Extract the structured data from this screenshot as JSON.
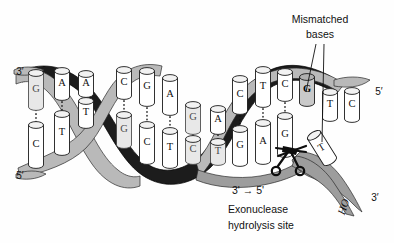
{
  "figure": {
    "background_color": "#fefefe"
  },
  "labels": {
    "mismatched_line1": "Mismatched",
    "mismatched_line2": "bases",
    "direction": "3'  →  5'",
    "site_line1": "Exonuclease",
    "site_line2": "hydrolysis site",
    "ho_label": "HO",
    "end_top_left": "3′",
    "end_bottom_left": "5′",
    "end_top_right": "5′",
    "end_bottom_right": "3′"
  },
  "colors": {
    "ribbon_dark": "#1c1c1c",
    "ribbon_light": "#b9b9b9",
    "ribbon_mid": "#9d9d9d",
    "base_fill": "#ffffff",
    "mismatch_fill": "#c9c9c9",
    "ink": "#111111"
  },
  "strands": {
    "top_strand_3prime_to_right": [
      "G",
      "A",
      "A",
      "C",
      "G",
      "A",
      "G",
      "A",
      "C",
      "T",
      "C",
      "G",
      "T",
      "C"
    ],
    "bottom_strand_5prime_to_right": [
      "C",
      "T",
      "T",
      "G",
      "C",
      "T",
      "C",
      "T",
      "G",
      "A",
      "G",
      "T"
    ]
  },
  "bases": {
    "top": [
      {
        "id": "t1",
        "letter": "G",
        "x": 36,
        "y": 90,
        "style": "faint",
        "h": 34
      },
      {
        "id": "t2",
        "letter": "A",
        "x": 62,
        "y": 84,
        "style": "plain",
        "h": 26
      },
      {
        "id": "t3",
        "letter": "A",
        "x": 86,
        "y": 84,
        "style": "plain",
        "h": 20
      },
      {
        "id": "t4",
        "letter": "C",
        "x": 124,
        "y": 83,
        "style": "plain",
        "h": 26
      },
      {
        "id": "t5",
        "letter": "G",
        "x": 147,
        "y": 87,
        "style": "plain",
        "h": 32
      },
      {
        "id": "t6",
        "letter": "A",
        "x": 170,
        "y": 95,
        "style": "plain",
        "h": 34
      },
      {
        "id": "t7",
        "letter": "G",
        "x": 193,
        "y": 118,
        "style": "faint",
        "h": 26
      },
      {
        "id": "t8",
        "letter": "A",
        "x": 218,
        "y": 120,
        "style": "plain",
        "h": 22
      },
      {
        "id": "t9",
        "letter": "C",
        "x": 240,
        "y": 95,
        "style": "plain",
        "h": 32
      },
      {
        "id": "t10",
        "letter": "T",
        "x": 263,
        "y": 87,
        "style": "plain",
        "h": 34
      },
      {
        "id": "t11",
        "letter": "C",
        "x": 285,
        "y": 85,
        "style": "plain",
        "h": 26
      },
      {
        "id": "t12",
        "letter": "G",
        "x": 307,
        "y": 90,
        "style": "mismatch",
        "h": 26
      },
      {
        "id": "t13",
        "letter": "T",
        "x": 330,
        "y": 105,
        "style": "plain",
        "h": 26
      },
      {
        "id": "t14",
        "letter": "C",
        "x": 352,
        "y": 105,
        "style": "plain",
        "h": 28
      }
    ],
    "bottom": [
      {
        "id": "b1",
        "letter": "C",
        "x": 36,
        "y": 145,
        "style": "plain",
        "h": 40
      },
      {
        "id": "b2",
        "letter": "T",
        "x": 62,
        "y": 133,
        "style": "plain",
        "h": 38
      },
      {
        "id": "b3",
        "letter": "T",
        "x": 86,
        "y": 113,
        "style": "plain",
        "h": 24
      },
      {
        "id": "b4",
        "letter": "G",
        "x": 124,
        "y": 130,
        "style": "faint",
        "h": 30
      },
      {
        "id": "b5",
        "letter": "C",
        "x": 147,
        "y": 143,
        "style": "plain",
        "h": 36
      },
      {
        "id": "b6",
        "letter": "T",
        "x": 170,
        "y": 148,
        "style": "plain",
        "h": 34
      },
      {
        "id": "b7",
        "letter": "C",
        "x": 193,
        "y": 150,
        "style": "faint",
        "h": 22
      },
      {
        "id": "b8",
        "letter": "T",
        "x": 218,
        "y": 152,
        "style": "faint",
        "h": 20
      },
      {
        "id": "b9",
        "letter": "G",
        "x": 240,
        "y": 146,
        "style": "plain",
        "h": 34
      },
      {
        "id": "b10",
        "letter": "A",
        "x": 263,
        "y": 142,
        "style": "plain",
        "h": 38
      },
      {
        "id": "b11",
        "letter": "G",
        "x": 285,
        "y": 135,
        "style": "plain",
        "h": 38
      },
      {
        "id": "b12",
        "letter": "T",
        "x": 322,
        "y": 148,
        "style": "tilted",
        "h": 30
      }
    ]
  },
  "hbonds": [
    {
      "x": 36,
      "y1": 110,
      "y2": 126
    },
    {
      "x": 62,
      "y1": 98,
      "y2": 116
    },
    {
      "x": 86,
      "y1": 93,
      "y2": 102
    },
    {
      "x": 124,
      "y1": 97,
      "y2": 116
    },
    {
      "x": 147,
      "y1": 104,
      "y2": 126
    },
    {
      "x": 170,
      "y1": 113,
      "y2": 132
    },
    {
      "x": 193,
      "y1": 131,
      "y2": 140
    },
    {
      "x": 218,
      "y1": 131,
      "y2": 143
    },
    {
      "x": 240,
      "y1": 112,
      "y2": 130
    },
    {
      "x": 263,
      "y1": 105,
      "y2": 124
    },
    {
      "x": 285,
      "y1": 99,
      "y2": 117
    }
  ],
  "annotations": {
    "mismatched_callout_x": 320,
    "mismatched_callout_y": 22,
    "scissors_x": 292,
    "scissors_y": 158
  }
}
